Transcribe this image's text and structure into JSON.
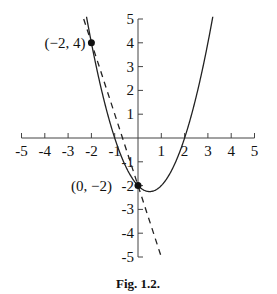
{
  "chart_data": {
    "type": "line",
    "title": "",
    "caption": "Fig. 1.2.",
    "xlabel": "",
    "ylabel": "",
    "xlim": [
      -5,
      5
    ],
    "ylim": [
      -5,
      5
    ],
    "x_ticks": [
      -5,
      -4,
      -3,
      -2,
      -1,
      1,
      2,
      3,
      4,
      5
    ],
    "y_ticks": [
      -5,
      -4,
      -3,
      -2,
      -1,
      1,
      2,
      3,
      4,
      5
    ],
    "grid": false,
    "series": [
      {
        "name": "parabola",
        "style": "solid",
        "equation": "y = x^2 - x - 2",
        "x": [
          -2.2,
          -2,
          -1.5,
          -1,
          -0.5,
          0,
          0.5,
          1,
          1.5,
          2,
          2.5,
          3,
          3.2
        ],
        "values": [
          5.04,
          4,
          1.75,
          0,
          -1.25,
          -2,
          -2.25,
          -2,
          -1.25,
          0,
          1.75,
          4,
          5.04
        ]
      },
      {
        "name": "line",
        "style": "dashed",
        "equation": "y = -3x - 2",
        "x": [
          -2.33,
          1
        ],
        "values": [
          5,
          -5
        ]
      }
    ],
    "points": [
      {
        "x": -2,
        "y": 4,
        "label": "(−2, 4)"
      },
      {
        "x": 0,
        "y": -2,
        "label": "(0, −2)"
      }
    ]
  },
  "labels": {
    "caption": "Fig. 1.2.",
    "point_a": "(−2, 4)",
    "point_b": "(0, −2)",
    "x_ticks": [
      "-5",
      "-4",
      "-3",
      "-2",
      "-1",
      "1",
      "2",
      "3",
      "4",
      "5"
    ],
    "y_ticks": [
      "5",
      "4",
      "3",
      "2",
      "1",
      "-1",
      "-2",
      "-3",
      "-4",
      "-5"
    ]
  }
}
